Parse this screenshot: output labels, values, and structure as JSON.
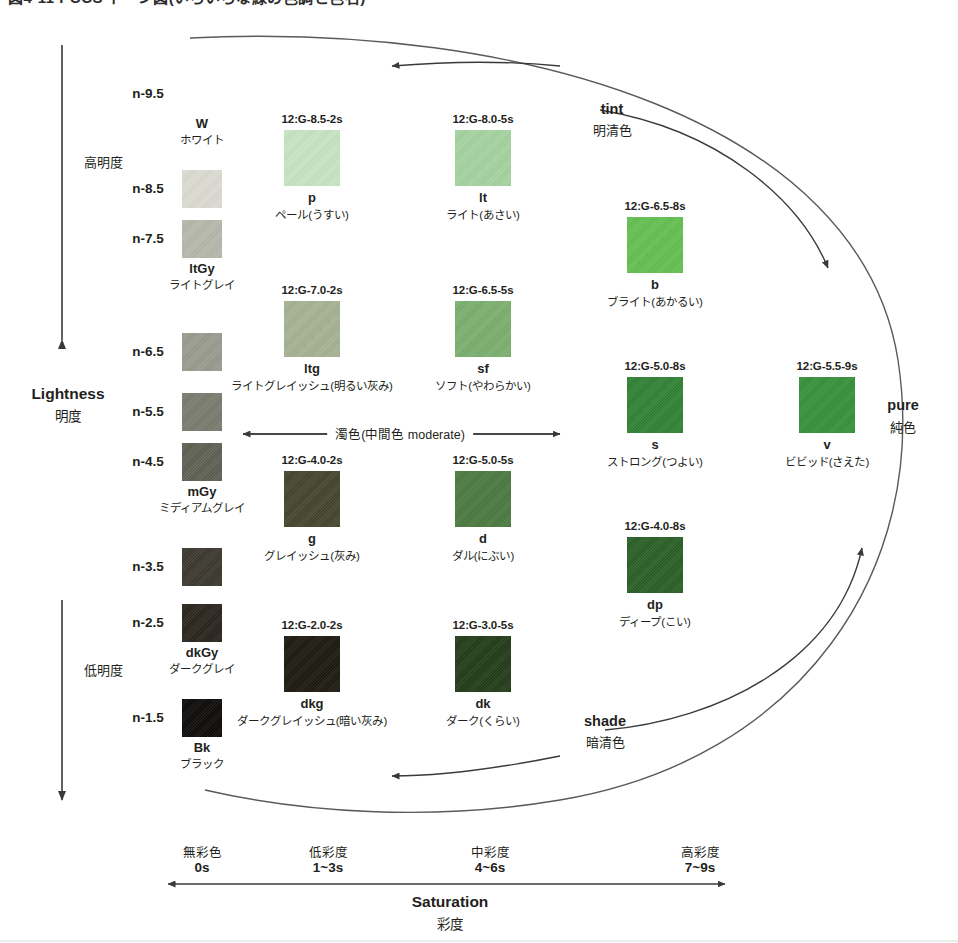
{
  "title": "図4-11 PCCS トーン図(いろいろな緑の色調と色名)",
  "axes": {
    "lightness": {
      "en": "Lightness",
      "jp": "明度"
    },
    "saturation": {
      "en": "Saturation",
      "jp": "彩度"
    },
    "high_lightness": "高明度",
    "low_lightness": "低明度",
    "moderate_band": "濁色(中間色 moderate)"
  },
  "zones": [
    {
      "id": "tint",
      "en": "tint",
      "jp": "明清色"
    },
    {
      "id": "pure",
      "en": "pure",
      "jp": "純色"
    },
    {
      "id": "shade",
      "en": "shade",
      "jp": "暗清色"
    }
  ],
  "lightness_ticks": [
    {
      "label": "n-9.5",
      "y": 94
    },
    {
      "label": "n-8.5",
      "y": 189
    },
    {
      "label": "n-7.5",
      "y": 239
    },
    {
      "label": "n-6.5",
      "y": 352
    },
    {
      "label": "n-5.5",
      "y": 412
    },
    {
      "label": "n-4.5",
      "y": 462
    },
    {
      "label": "n-3.5",
      "y": 567
    },
    {
      "label": "n-2.5",
      "y": 623
    },
    {
      "label": "n-1.5",
      "y": 718
    }
  ],
  "saturation_ticks": [
    {
      "jp": "無彩色",
      "range": "0s",
      "x": 202
    },
    {
      "jp": "低彩度",
      "range": "1~3s",
      "x": 328
    },
    {
      "jp": "中彩度",
      "range": "4~6s",
      "x": 490
    },
    {
      "jp": "高彩度",
      "range": "7~9s",
      "x": 700
    }
  ],
  "grays": [
    {
      "name": "W",
      "jp": "ホワイト",
      "hex": "#fdfdfb",
      "label_above": true,
      "x": 202,
      "y": 132,
      "show_swatch": false
    },
    {
      "name": "",
      "jp": "",
      "hex": "#dcdcd3",
      "x": 202,
      "y": 189,
      "show_swatch": true
    },
    {
      "name": "ltGy",
      "jp": "ライトグレイ",
      "hex": "#b8b9ac",
      "x": 202,
      "y": 239,
      "show_swatch": true
    },
    {
      "name": "",
      "jp": "",
      "hex": "#9a9c8f",
      "x": 202,
      "y": 352,
      "show_swatch": true
    },
    {
      "name": "",
      "jp": "",
      "hex": "#797c6e",
      "x": 202,
      "y": 412,
      "show_swatch": true
    },
    {
      "name": "mGy",
      "jp": "ミディアムグレイ",
      "hex": "#5e6152",
      "x": 202,
      "y": 462,
      "show_swatch": true
    },
    {
      "name": "",
      "jp": "",
      "hex": "#3c3830",
      "x": 202,
      "y": 567,
      "show_swatch": true
    },
    {
      "name": "dkGy",
      "jp": "ダークグレイ",
      "hex": "#2a251d",
      "x": 202,
      "y": 623,
      "show_swatch": true
    },
    {
      "name": "Bk",
      "jp": "ブラック",
      "hex": "#0d0c0a",
      "x": 202,
      "y": 718,
      "show_swatch": true
    }
  ],
  "tones": [
    {
      "id": "p",
      "code": "12:G-8.5-2s",
      "abbr": "p",
      "jp": "ペール(うすい)",
      "hex": "#c8e5c4",
      "x": 312,
      "y": 130
    },
    {
      "id": "lt",
      "code": "12:G-8.0-5s",
      "abbr": "lt",
      "jp": "ライト(あさい)",
      "hex": "#a5d4a0",
      "x": 483,
      "y": 130
    },
    {
      "id": "b",
      "code": "12:G-6.5-8s",
      "abbr": "b",
      "jp": "ブライト(あかるい)",
      "hex": "#64c052",
      "x": 655,
      "y": 217
    },
    {
      "id": "ltg",
      "code": "12:G-7.0-2s",
      "abbr": "ltg",
      "jp": "ライトグレイッシュ(明るい灰み)",
      "hex": "#a7b393",
      "x": 312,
      "y": 301
    },
    {
      "id": "sf",
      "code": "12:G-6.5-5s",
      "abbr": "sf",
      "jp": "ソフト(やわらかい)",
      "hex": "#7cb070",
      "x": 483,
      "y": 301
    },
    {
      "id": "s",
      "code": "12:G-5.0-8s",
      "abbr": "s",
      "jp": "ストロング(つよい)",
      "hex": "#318336",
      "x": 655,
      "y": 377
    },
    {
      "id": "v",
      "code": "12:G-5.5-9s",
      "abbr": "v",
      "jp": "ビビッド(さえた)",
      "hex": "#37913b",
      "x": 827,
      "y": 377
    },
    {
      "id": "g",
      "code": "12:G-4.0-2s",
      "abbr": "g",
      "jp": "グレイッシュ(灰み)",
      "hex": "#45462d",
      "x": 312,
      "y": 471
    },
    {
      "id": "d",
      "code": "12:G-5.0-5s",
      "abbr": "d",
      "jp": "ダル(にぶい)",
      "hex": "#4c7a41",
      "x": 483,
      "y": 471
    },
    {
      "id": "dp",
      "code": "12:G-4.0-8s",
      "abbr": "dp",
      "jp": "ディープ(こい)",
      "hex": "#2b6027",
      "x": 655,
      "y": 537
    },
    {
      "id": "dkg",
      "code": "12:G-2.0-2s",
      "abbr": "dkg",
      "jp": "ダークグレイッシュ(暗い灰み)",
      "hex": "#1d1a10",
      "x": 312,
      "y": 636
    },
    {
      "id": "dk",
      "code": "12:G-3.0-5s",
      "abbr": "dk",
      "jp": "ダーク(くらい)",
      "hex": "#243d1a",
      "x": 483,
      "y": 636
    }
  ]
}
